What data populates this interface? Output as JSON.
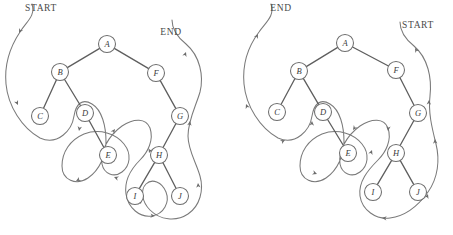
{
  "figure": {
    "background_color": "#ffffff",
    "stroke_color": "#6b6b6b",
    "node_fill_color": "#ffffff",
    "label_color": "#3a3a3a",
    "width": 453,
    "height": 235
  },
  "diagrams": [
    {
      "id": "left",
      "name": "preorder-traversal-diagram",
      "start_label": "START",
      "end_label": "END",
      "start_label_pos": {
        "x": 41,
        "y": 8
      },
      "end_label_pos": {
        "x": 171,
        "y": 32
      },
      "tour_direction": "clockwise",
      "nodes": [
        {
          "id": "A",
          "label": "A",
          "x": 107,
          "y": 44,
          "r": 8.5
        },
        {
          "id": "B",
          "label": "B",
          "x": 60,
          "y": 72,
          "r": 8.5
        },
        {
          "id": "C",
          "label": "C",
          "x": 40,
          "y": 116,
          "r": 8.5
        },
        {
          "id": "D",
          "label": "D",
          "x": 85,
          "y": 113,
          "r": 8.5
        },
        {
          "id": "E",
          "label": "E",
          "x": 108,
          "y": 155,
          "r": 8.5
        },
        {
          "id": "F",
          "label": "F",
          "x": 156,
          "y": 73,
          "r": 8.5
        },
        {
          "id": "G",
          "label": "G",
          "x": 180,
          "y": 116,
          "r": 8.5
        },
        {
          "id": "H",
          "label": "H",
          "x": 159,
          "y": 155,
          "r": 8.5
        },
        {
          "id": "I",
          "label": "I",
          "x": 135,
          "y": 196,
          "r": 8.5
        },
        {
          "id": "J",
          "label": "J",
          "x": 180,
          "y": 196,
          "r": 8.5
        }
      ],
      "edges": [
        {
          "from": "A",
          "to": "B"
        },
        {
          "from": "A",
          "to": "F"
        },
        {
          "from": "B",
          "to": "C"
        },
        {
          "from": "B",
          "to": "D"
        },
        {
          "from": "D",
          "to": "E"
        },
        {
          "from": "F",
          "to": "G"
        },
        {
          "from": "G",
          "to": "H"
        },
        {
          "from": "H",
          "to": "I"
        },
        {
          "from": "H",
          "to": "J"
        }
      ],
      "tour_path": "M 32 4 C 36 16 26 22 20 32 C 12 44 4 62 6 84 C 8 106 22 128 40 138 C 58 146 72 130 74 116 C 76 104 82 98 92 104 C 102 110 106 126 106 142 C 106 154 100 170 88 178 C 76 186 62 180 62 166 C 62 152 70 140 84 134 C 100 128 116 134 124 144 C 132 154 130 166 122 172 C 114 178 104 174 102 164 C 100 152 108 136 122 126 C 134 118 146 118 150 128 C 154 140 148 152 140 160 C 132 168 124 180 126 194 C 128 208 140 218 152 216 C 164 214 170 202 166 192 C 162 182 152 178 146 184 C 140 190 142 202 150 210 C 160 220 176 222 188 214 C 200 206 204 190 200 176 C 196 162 188 150 188 136 C 188 120 196 106 200 92 C 204 76 200 56 186 44 C 176 36 172 28 172 20",
      "tour_arrows": [
        {
          "x": 19,
          "y": 33,
          "angle": 118
        },
        {
          "x": 18,
          "y": 105,
          "angle": 65
        },
        {
          "x": 79,
          "y": 131,
          "angle": 100
        },
        {
          "x": 76,
          "y": 181,
          "angle": 152
        },
        {
          "x": 114,
          "y": 177,
          "angle": 200
        },
        {
          "x": 115,
          "y": 129,
          "angle": 305
        },
        {
          "x": 149,
          "y": 153,
          "angle": 110
        },
        {
          "x": 141,
          "y": 204,
          "angle": 70
        },
        {
          "x": 155,
          "y": 216,
          "angle": 5
        },
        {
          "x": 198,
          "y": 183,
          "angle": 265
        },
        {
          "x": 190,
          "y": 121,
          "angle": 278
        },
        {
          "x": 186,
          "y": 52,
          "angle": 290
        }
      ]
    },
    {
      "id": "right",
      "name": "postorder-traversal-diagram",
      "start_label": "START",
      "end_label": "END",
      "start_label_pos": {
        "x": 418,
        "y": 25
      },
      "end_label_pos": {
        "x": 281,
        "y": 8
      },
      "tour_direction": "counterclockwise",
      "nodes": [
        {
          "id": "A",
          "label": "A",
          "x": 345,
          "y": 43,
          "r": 8.5
        },
        {
          "id": "B",
          "label": "B",
          "x": 299,
          "y": 71,
          "r": 8.5
        },
        {
          "id": "C",
          "label": "C",
          "x": 277,
          "y": 112,
          "r": 8.5
        },
        {
          "id": "D",
          "label": "D",
          "x": 323,
          "y": 112,
          "r": 8.5
        },
        {
          "id": "E",
          "label": "E",
          "x": 348,
          "y": 153,
          "r": 8.5
        },
        {
          "id": "F",
          "label": "F",
          "x": 396,
          "y": 70,
          "r": 8.5
        },
        {
          "id": "G",
          "label": "G",
          "x": 418,
          "y": 113,
          "r": 8.5
        },
        {
          "id": "H",
          "label": "H",
          "x": 396,
          "y": 153,
          "r": 8.5
        },
        {
          "id": "I",
          "label": "I",
          "x": 373,
          "y": 192,
          "r": 8.5
        },
        {
          "id": "J",
          "label": "J",
          "x": 418,
          "y": 192,
          "r": 8.5
        }
      ],
      "edges": [
        {
          "from": "A",
          "to": "B"
        },
        {
          "from": "A",
          "to": "F"
        },
        {
          "from": "B",
          "to": "C"
        },
        {
          "from": "B",
          "to": "D"
        },
        {
          "from": "D",
          "to": "E"
        },
        {
          "from": "F",
          "to": "G"
        },
        {
          "from": "G",
          "to": "H"
        },
        {
          "from": "H",
          "to": "I"
        },
        {
          "from": "H",
          "to": "J"
        }
      ],
      "tour_path": "M 271 4 C 275 16 266 22 259 32 C 250 44 242 62 244 84 C 246 106 260 128 278 138 C 296 146 310 130 312 116 C 314 104 320 98 330 104 C 340 110 344 126 344 142 C 344 154 338 170 326 178 C 314 186 300 180 300 166 C 300 152 308 140 322 134 C 338 128 354 134 362 144 C 370 154 368 166 360 172 C 352 178 342 174 340 164 C 338 152 346 136 360 126 C 372 118 384 118 388 128 C 392 140 386 152 378 160 C 368 170 358 182 360 196 C 362 210 376 220 390 218 C 406 216 418 206 428 192 C 438 178 440 160 436 144 C 432 128 428 112 430 96 C 432 78 428 58 414 46 C 404 38 400 30 400 22",
      "tour_arrows": [
        {
          "x": 258,
          "y": 34,
          "angle": 298
        },
        {
          "x": 246,
          "y": 104,
          "angle": 248
        },
        {
          "x": 285,
          "y": 140,
          "angle": 332
        },
        {
          "x": 312,
          "y": 121,
          "angle": 272
        },
        {
          "x": 317,
          "y": 174,
          "angle": 20
        },
        {
          "x": 353,
          "y": 130,
          "angle": 125
        },
        {
          "x": 372,
          "y": 150,
          "angle": 290
        },
        {
          "x": 388,
          "y": 131,
          "angle": 95
        },
        {
          "x": 382,
          "y": 218,
          "angle": 185
        },
        {
          "x": 428,
          "y": 194,
          "angle": 290
        },
        {
          "x": 435,
          "y": 139,
          "angle": 268
        },
        {
          "x": 429,
          "y": 100,
          "angle": 272
        },
        {
          "x": 415,
          "y": 48,
          "angle": 240
        }
      ]
    }
  ]
}
